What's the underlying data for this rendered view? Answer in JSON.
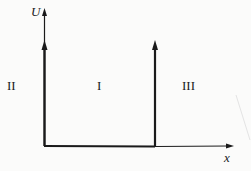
{
  "diagram": {
    "axes": {
      "y_label": "U",
      "x_label": "x"
    },
    "regions": [
      {
        "id": "II",
        "label": "II"
      },
      {
        "id": "I",
        "label": "I"
      },
      {
        "id": "III",
        "label": "III"
      }
    ],
    "colors": {
      "line": "#1a1a1a",
      "background": "#fbfbfa"
    }
  }
}
